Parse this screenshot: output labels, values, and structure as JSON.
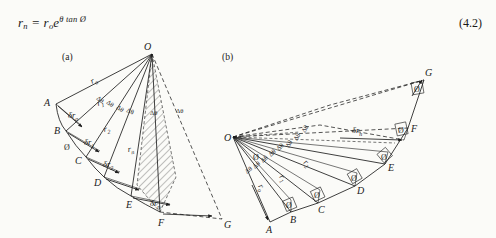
{
  "equation": {
    "lhs_var": "r",
    "lhs_sub": "n",
    "eq_sign": "=",
    "rhs_var": "r",
    "rhs_sub": "o",
    "rhs_base": "e",
    "rhs_exponent": "θ tan Ø",
    "plain": "r_n = r_o e^(θ tan Ø)",
    "number": "(4.2)"
  },
  "panels": [
    {
      "id": "a",
      "label": "(a)"
    },
    {
      "id": "b",
      "label": "(b)"
    }
  ],
  "figure_a": {
    "origin_label": "O",
    "points": [
      "A",
      "B",
      "C",
      "D",
      "E",
      "F",
      "G"
    ],
    "radii": [
      "r",
      "r",
      "r",
      "r"
    ],
    "radius_labels": [
      {
        "text": "r",
        "sub": "o"
      },
      {
        "text": "r",
        "sub": "1"
      },
      {
        "text": "r",
        "sub": "2"
      },
      {
        "text": "r",
        "sub": "n"
      }
    ],
    "delta_r_labels": [
      {
        "text": "δr",
        "sub": "o"
      },
      {
        "text": "δr",
        "sub": "1"
      },
      {
        "text": "δr",
        "sub": "2"
      },
      {
        "text": "δr",
        "sub": "n"
      }
    ],
    "delta_theta_label": "Δθ",
    "delta_theta_count": 6,
    "angle_symbol": "Ø",
    "angle_symbol_count": 1,
    "hatched_region": true
  },
  "figure_b": {
    "origin_label": "O",
    "points": [
      "A",
      "B",
      "C",
      "D",
      "E",
      "F",
      "G"
    ],
    "radius_labels": [
      {
        "text": "r",
        "sub": "o"
      },
      {
        "text": "r",
        "sub": "1"
      },
      {
        "text": "r",
        "sub": "2"
      }
    ],
    "delta_r_labels": [
      {
        "text": "δr",
        "sub": "n"
      }
    ],
    "delta_theta_label": "Δθ",
    "delta_theta_count_lower": 5,
    "delta_theta_count_upper": 3,
    "angle_symbol": "Ø",
    "angle_symbol_count": 6,
    "hatched_region": false
  },
  "colors": {
    "ink": "#1d1d1d",
    "paper": "#fbfbf8"
  }
}
